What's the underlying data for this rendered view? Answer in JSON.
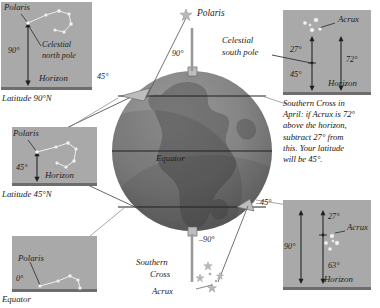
{
  "figure": {
    "colors": {
      "panel_bg": "#a9a9a9",
      "ground": "#6d6d6d",
      "globe_light": "#8f8f8f",
      "globe_dark": "#6f6f6f",
      "line": "#2a2a2a",
      "star": "#f2f2f2",
      "text": "#141414",
      "page_bg": "#ffffff"
    }
  },
  "panels": [
    {
      "id": "north-pole",
      "caption": "Latitude 90°N",
      "star_label": "Polaris",
      "pole_label": "Celestial\nnorth pole",
      "angle": "90°",
      "horizon_label": "Horizon",
      "constellation": "big-dipper"
    },
    {
      "id": "lat-45-north",
      "caption": "Latitude 45°N",
      "star_label": "Polaris",
      "angle": "45°",
      "horizon_label": "Horizon",
      "constellation": "big-dipper"
    },
    {
      "id": "equator",
      "caption": "Equator",
      "star_label": "Polaris",
      "angle": "0°",
      "horizon_label": "",
      "constellation": "big-dipper"
    },
    {
      "id": "southern-cross-april",
      "caption": "Southern Cross in April: if Acrux is 72° above the horizon, subtract 27° from this. Your latitude will be 45°.",
      "star_label": "Acrux",
      "pole_label": "Celestial\nsouth pole",
      "angle_upper": "27°",
      "angle_lower": "45°",
      "angle_total": "72°",
      "horizon_label": "Horizon",
      "constellation": "southern-cross"
    },
    {
      "id": "southern-cross-lower",
      "caption": "",
      "star_label": "Acrux",
      "angle_upper": "27°",
      "angle_lower": "63°",
      "angle_total": "90°",
      "horizon_label": "Horizon",
      "constellation": "southern-cross"
    }
  ],
  "globe": {
    "polaris_label": "Polaris",
    "equator_label": "Equator",
    "southern_cross_label": "Southern\nCross",
    "southern_cross_line1": "Southern",
    "southern_cross_line2": "Cross",
    "acrux_label": "Acrux",
    "angles": {
      "north_pole": "90°",
      "mid_north": "45°",
      "mid_south": "–45°",
      "south_pole": "–90°"
    }
  },
  "caption_southern_cross": {
    "lines": [
      "Southern Cross in",
      "April: if Acrux is 72°",
      "above the horizon,",
      "subtract 27° from",
      "this. Your latitude",
      "will be 45°."
    ]
  },
  "pole_labels": {
    "north_line1": "Celestial",
    "north_line2": "north pole",
    "south_line1": "Celestial",
    "south_line2": "south pole"
  }
}
